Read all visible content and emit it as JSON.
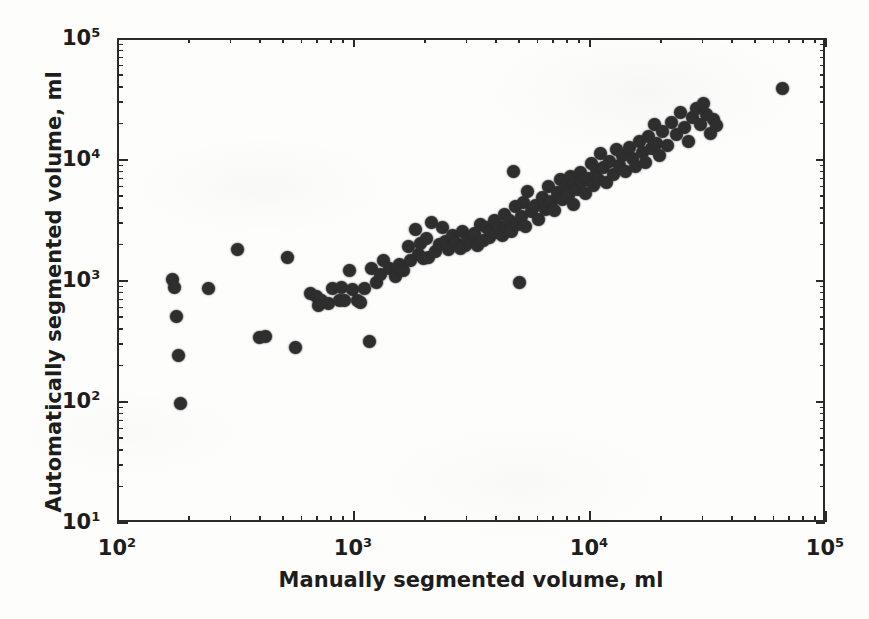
{
  "chart_data": {
    "type": "scatter",
    "title": "",
    "xlabel": "Manually segmented volume, ml",
    "ylabel": "Automatically segmented volume, ml",
    "xscale": "log",
    "yscale": "log",
    "xlim": [
      100,
      100000
    ],
    "ylim": [
      10,
      100000
    ],
    "grid": false,
    "legend": null,
    "marker_color": "#2e2e2e",
    "marker_size_px": 13,
    "xticks": [
      100,
      1000,
      10000,
      100000
    ],
    "xtick_labels": [
      "10",
      "10",
      "10",
      "10"
    ],
    "xtick_exponents": [
      "2",
      "3",
      "4",
      "5"
    ],
    "yticks": [
      10,
      100,
      1000,
      10000,
      100000
    ],
    "ytick_labels": [
      "10",
      "10",
      "10",
      "10",
      "10"
    ],
    "ytick_exponents": [
      "1",
      "2",
      "3",
      "4",
      "5"
    ],
    "xminor_per_decade": [
      2,
      3,
      4,
      5,
      6,
      7,
      8,
      9
    ],
    "n_points": 139,
    "points": [
      [
        168,
        1050
      ],
      [
        172,
        900
      ],
      [
        176,
        520
      ],
      [
        178,
        245
      ],
      [
        182,
        100
      ],
      [
        240,
        880
      ],
      [
        318,
        1850
      ],
      [
        395,
        350
      ],
      [
        418,
        355
      ],
      [
        520,
        1600
      ],
      [
        560,
        285
      ],
      [
        650,
        800
      ],
      [
        690,
        760
      ],
      [
        700,
        640
      ],
      [
        720,
        700
      ],
      [
        770,
        660
      ],
      [
        800,
        880
      ],
      [
        860,
        700
      ],
      [
        880,
        900
      ],
      [
        900,
        700
      ],
      [
        950,
        1250
      ],
      [
        980,
        860
      ],
      [
        1020,
        700
      ],
      [
        1060,
        680
      ],
      [
        1100,
        880
      ],
      [
        1150,
        320
      ],
      [
        1180,
        1300
      ],
      [
        1230,
        1000
      ],
      [
        1280,
        1150
      ],
      [
        1320,
        1500
      ],
      [
        1400,
        1300
      ],
      [
        1480,
        1100
      ],
      [
        1550,
        1400
      ],
      [
        1600,
        1250
      ],
      [
        1680,
        1950
      ],
      [
        1720,
        1500
      ],
      [
        1800,
        2700
      ],
      [
        1850,
        1700
      ],
      [
        1900,
        2100
      ],
      [
        1950,
        1550
      ],
      [
        2000,
        2300
      ],
      [
        2050,
        1600
      ],
      [
        2100,
        3100
      ],
      [
        2200,
        1800
      ],
      [
        2280,
        2050
      ],
      [
        2350,
        2800
      ],
      [
        2420,
        2150
      ],
      [
        2500,
        1850
      ],
      [
        2600,
        2400
      ],
      [
        2700,
        2100
      ],
      [
        2800,
        1900
      ],
      [
        2850,
        2600
      ],
      [
        2950,
        2000
      ],
      [
        3000,
        2350
      ],
      [
        3100,
        2150
      ],
      [
        3200,
        2500
      ],
      [
        3300,
        2000
      ],
      [
        3400,
        3000
      ],
      [
        3500,
        2200
      ],
      [
        3600,
        2800
      ],
      [
        3700,
        2350
      ],
      [
        3800,
        2600
      ],
      [
        3900,
        3200
      ],
      [
        4000,
        2550
      ],
      [
        4100,
        2900
      ],
      [
        4200,
        2400
      ],
      [
        4300,
        3600
      ],
      [
        4400,
        2800
      ],
      [
        4500,
        3200
      ],
      [
        4600,
        2600
      ],
      [
        4700,
        8200
      ],
      [
        4800,
        4200
      ],
      [
        4900,
        3000
      ],
      [
        5000,
        1000
      ],
      [
        5100,
        3500
      ],
      [
        5200,
        4500
      ],
      [
        5300,
        2900
      ],
      [
        5400,
        5600
      ],
      [
        5600,
        3800
      ],
      [
        5800,
        4300
      ],
      [
        6000,
        3300
      ],
      [
        6200,
        5000
      ],
      [
        6400,
        4000
      ],
      [
        6600,
        6200
      ],
      [
        6800,
        4600
      ],
      [
        7000,
        3900
      ],
      [
        7200,
        5500
      ],
      [
        7400,
        7000
      ],
      [
        7600,
        4800
      ],
      [
        7800,
        6000
      ],
      [
        8000,
        5200
      ],
      [
        8200,
        7500
      ],
      [
        8400,
        4400
      ],
      [
        8600,
        6500
      ],
      [
        8800,
        5800
      ],
      [
        9000,
        8000
      ],
      [
        9200,
        6800
      ],
      [
        9500,
        5400
      ],
      [
        9800,
        7200
      ],
      [
        10000,
        9500
      ],
      [
        10200,
        6300
      ],
      [
        10500,
        8500
      ],
      [
        10800,
        7000
      ],
      [
        11000,
        11500
      ],
      [
        11300,
        8800
      ],
      [
        11600,
        6600
      ],
      [
        12000,
        10000
      ],
      [
        12400,
        7800
      ],
      [
        12800,
        12500
      ],
      [
        13200,
        9200
      ],
      [
        13600,
        11000
      ],
      [
        14000,
        8200
      ],
      [
        14500,
        13000
      ],
      [
        15000,
        10500
      ],
      [
        15500,
        9000
      ],
      [
        16000,
        14500
      ],
      [
        16500,
        11800
      ],
      [
        17000,
        9800
      ],
      [
        17500,
        16000
      ],
      [
        18000,
        12800
      ],
      [
        18500,
        20000
      ],
      [
        19000,
        14000
      ],
      [
        19500,
        11000
      ],
      [
        20000,
        17500
      ],
      [
        21000,
        13500
      ],
      [
        22000,
        21000
      ],
      [
        23000,
        16500
      ],
      [
        24000,
        25000
      ],
      [
        25000,
        19000
      ],
      [
        26000,
        14500
      ],
      [
        27000,
        23000
      ],
      [
        28000,
        27000
      ],
      [
        29000,
        20000
      ],
      [
        30000,
        30000
      ],
      [
        31000,
        24000
      ],
      [
        32000,
        17000
      ],
      [
        33000,
        22000
      ],
      [
        34000,
        19500
      ],
      [
        65000,
        40000
      ]
    ]
  }
}
